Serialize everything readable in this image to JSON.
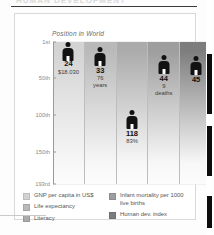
{
  "document": {
    "top_heading_ghost": "HUMAN DEVELOPMENT"
  },
  "figure": {
    "axis_title": "Position in World"
  },
  "legend": {
    "left_column": [
      {
        "label": "GNP per capita in US$",
        "color": "#d3d3d3"
      },
      {
        "label": "Life expectancy",
        "color": "#b9b9b9"
      },
      {
        "label": "Literacy",
        "color": "#ababab"
      }
    ],
    "right_column": [
      {
        "label": "Infant mortality per 1000 live births",
        "color": "#9e9e9e"
      },
      {
        "label": "Human dev. index",
        "color": "#7d7d7d"
      }
    ]
  },
  "chart_data": {
    "type": "bar",
    "title": "Position in World",
    "xlabel": "",
    "ylabel": "Position in World",
    "grid": true,
    "legend_position": "bottom",
    "y_axis": {
      "inverted": true,
      "ticks": [
        {
          "label": "1st",
          "value": 1
        },
        {
          "label": "50th",
          "value": 50
        },
        {
          "label": "100th",
          "value": 100
        },
        {
          "label": "150th",
          "value": 150
        },
        {
          "label": "193rd",
          "value": 193
        }
      ],
      "ylim": [
        1,
        193
      ]
    },
    "categories": [
      "GNP per capita in US$",
      "Life expectancy",
      "Literacy",
      "Infant mortality per 1000 live births",
      "Human dev. index"
    ],
    "values": [
      24,
      33,
      118,
      44,
      45
    ],
    "series": [
      {
        "name": "Position in World",
        "values": [
          24,
          33,
          118,
          44,
          45
        ]
      }
    ],
    "point_labels": [
      {
        "rank": "24",
        "sub_value": "$18.030",
        "sub_unit": ""
      },
      {
        "rank": "33",
        "sub_value": "76",
        "sub_unit": "years"
      },
      {
        "rank": "118",
        "sub_value": "83%",
        "sub_unit": ""
      },
      {
        "rank": "44",
        "sub_value": "9",
        "sub_unit": "deaths"
      },
      {
        "rank": "45",
        "sub_value": "",
        "sub_unit": ""
      }
    ],
    "column_colors": [
      "#d3d3d3",
      "#b9b9b9",
      "#ababab",
      "#9e9e9e",
      "#7d7d7d"
    ]
  }
}
